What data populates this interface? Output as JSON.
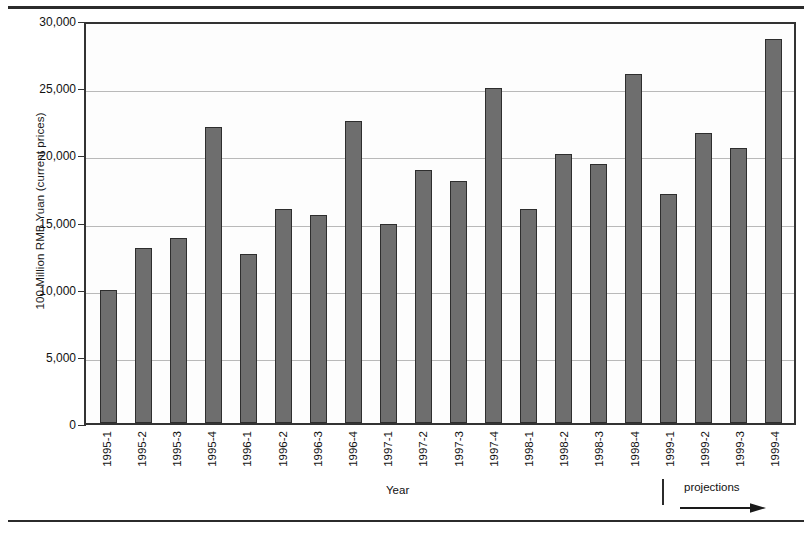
{
  "chart_data": {
    "type": "bar",
    "title": "",
    "xlabel": "Year",
    "ylabel": "100 Million RMB Yuan (current prices)",
    "ylim": [
      0,
      30000
    ],
    "ytick_labels": [
      "30,000",
      "25,000",
      "20,000",
      "15,000",
      "10,000",
      "5,000",
      "0"
    ],
    "ytick_values": [
      30000,
      25000,
      20000,
      15000,
      10000,
      5000,
      0
    ],
    "grid": true,
    "legend": "none",
    "categories": [
      "1995-1",
      "1995-2",
      "1995-3",
      "1995-4",
      "1996-1",
      "1996-2",
      "1996-3",
      "1996-4",
      "1997-1",
      "1997-2",
      "1997-3",
      "1997-4",
      "1998-1",
      "1998-2",
      "1998-3",
      "1998-4",
      "1999-1",
      "1999-2",
      "1999-3",
      "1999-4"
    ],
    "values": [
      9900,
      13000,
      13800,
      22000,
      12600,
      15950,
      15450,
      22500,
      14850,
      18850,
      18050,
      24950,
      15950,
      20000,
      19250,
      26000,
      17050,
      21600,
      20450,
      28600
    ],
    "annotations": {
      "projections_label": "projections",
      "projections_start_category": "1999-1"
    },
    "colors": {
      "bar_fill": "#6e6e6e",
      "bar_stroke": "#2e2e2e",
      "grid": "#b9b9b9",
      "axis": "#333333",
      "text": "#111111"
    }
  }
}
